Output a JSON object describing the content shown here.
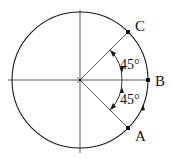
{
  "diagram": {
    "type": "unit-circle-angles",
    "center": {
      "x": 80,
      "y": 80
    },
    "radius": 68,
    "points": [
      {
        "label": "C",
        "angle_deg": 45
      },
      {
        "label": "B",
        "angle_deg": 0
      },
      {
        "label": "A",
        "angle_deg": -45
      }
    ],
    "angles": [
      {
        "label": "45°",
        "from": "B",
        "to": "C"
      },
      {
        "label": "45°",
        "from": "A",
        "to": "B"
      }
    ],
    "arc_arrow": "counterclockwise from A toward B",
    "colors": {
      "stroke": "#1a1a1a",
      "background": "#ffffff"
    }
  }
}
